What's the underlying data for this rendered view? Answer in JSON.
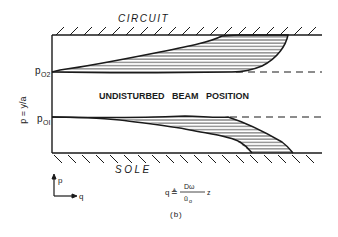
{
  "diagram": {
    "top_wall_label": "CIRCUIT",
    "bottom_wall_label": "SOLE",
    "center_label": "UNDISTURBED   BEAM   POSITION",
    "y_axis_label": "p = y/a",
    "upper_edge_label": "p",
    "upper_edge_subscript": "O2",
    "lower_edge_label": "p",
    "lower_edge_subscript": "OI",
    "axes_indicator": {
      "vertical": "p",
      "horizontal": "q"
    },
    "formula": {
      "lhs": "q",
      "relation": "≜",
      "numerator": "Dω",
      "denominator": "ū",
      "denominator_subscript": "o",
      "trailing": "z"
    },
    "caption": "(b)"
  },
  "colors": {
    "ink": "#1a1a1a",
    "background": "#ffffff"
  }
}
